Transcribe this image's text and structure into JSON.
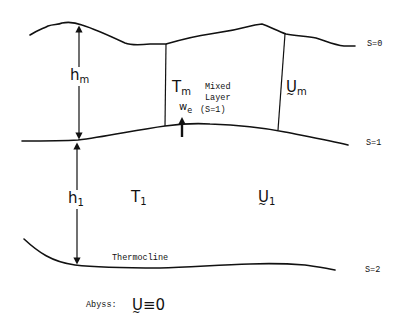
{
  "diagram": {
    "title": "",
    "surfaces": [
      {
        "id": "S0",
        "label": "S=0"
      },
      {
        "id": "S1",
        "label": "S=1"
      },
      {
        "id": "S2",
        "label": "S=2"
      }
    ],
    "mixed_layer": {
      "depth_label": "h",
      "depth_sub": "m",
      "temp_label": "T",
      "temp_sub": "m",
      "velocity_label": "U",
      "velocity_sub": "m",
      "name_line1": "Mixed",
      "name_line2": "Layer"
    },
    "entrainment": {
      "label": "w",
      "sub": "e",
      "note": "(S=1)"
    },
    "thermocline_layer": {
      "depth_label": "h",
      "depth_sub": "1",
      "temp_label": "T",
      "temp_sub": "1",
      "velocity_label": "U",
      "velocity_sub": "1",
      "name": "Thermocline"
    },
    "abyss": {
      "label": "Abyss:",
      "velocity_label": "U",
      "condition": "≡0"
    }
  }
}
